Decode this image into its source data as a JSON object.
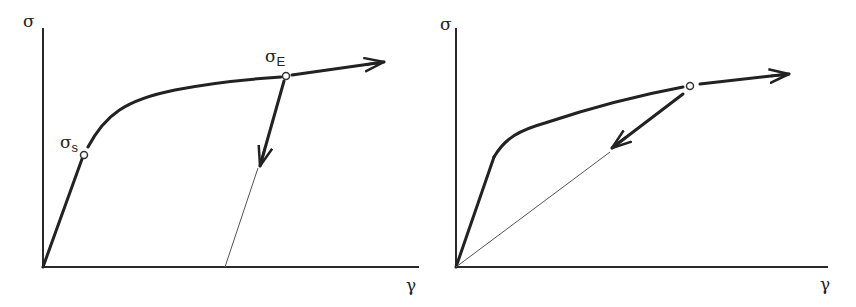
{
  "figure": {
    "background": "#ffffff",
    "line_color": "#222222",
    "panels": [
      {
        "id": "left",
        "y_axis_label": "σ",
        "x_axis_label": "γ",
        "points": [
          {
            "name": "yield-point",
            "symbol": "σ",
            "subscript": "s"
          },
          {
            "name": "unloading-start-point",
            "symbol": "σ",
            "subscript": "E"
          }
        ],
        "description": "Stress-strain curve: linear elastic to σs, hardening to σE, unloading parallel to elastic slope leaving permanent strain"
      },
      {
        "id": "right",
        "y_axis_label": "σ",
        "x_axis_label": "γ",
        "points": [
          {
            "name": "unloading-start-point",
            "symbol": "",
            "subscript": ""
          }
        ],
        "description": "Stress-strain curve: unloading line returns to origin (no permanent strain)"
      }
    ]
  }
}
